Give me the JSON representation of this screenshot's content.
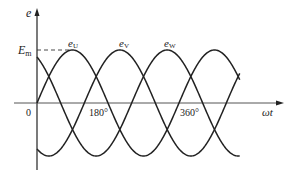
{
  "chart_data": {
    "type": "line",
    "xlabel": "ωt",
    "ylabel": "e",
    "amplitude_label": "E_m",
    "origin_label": "0",
    "x_ticks": [
      {
        "label": "180°",
        "value": 180
      },
      {
        "label": "360°",
        "value": 360
      }
    ],
    "series": [
      {
        "name": "e_U",
        "label_main": "e",
        "label_sub": "U",
        "phase_deg": 0
      },
      {
        "name": "e_V",
        "label_main": "e",
        "label_sub": "V",
        "phase_deg": -120
      },
      {
        "name": "e_W",
        "label_main": "e",
        "label_sub": "W",
        "phase_deg": 120
      }
    ],
    "x_range_deg": [
      0,
      515
    ],
    "grid": false,
    "legend": "inline labels above peaks"
  },
  "labels": {
    "y_axis": "e",
    "x_axis": "ωt",
    "em_main": "E",
    "em_sub": "m",
    "origin": "0",
    "tick_180": "180°",
    "tick_360": "360°",
    "eu_main": "e",
    "eu_sub": "U",
    "ev_main": "e",
    "ev_sub": "V",
    "ew_main": "e",
    "ew_sub": "W"
  }
}
